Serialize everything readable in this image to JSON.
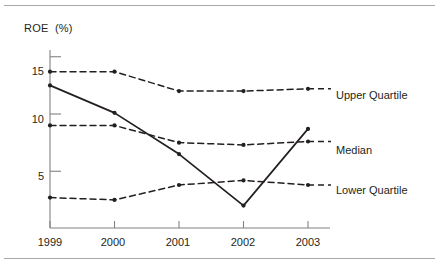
{
  "figure": {
    "axis_title": "ROE  (%)",
    "line_color": "#231f20",
    "rule_color": "#a7a9ac"
  },
  "chart_data": {
    "type": "line",
    "title": "",
    "subtitle": "",
    "xlabel": "",
    "ylabel": "ROE  (%)",
    "categories": [
      "1999",
      "2000",
      "2001",
      "2002",
      "2003"
    ],
    "x": [
      1999,
      2000,
      2001,
      2002,
      2003
    ],
    "ylim": [
      0,
      16.5
    ],
    "xlim": [
      1998.8,
      2003.4
    ],
    "yticks": [
      5,
      10,
      15
    ],
    "ytick_labels": [
      "5",
      "10",
      "15"
    ],
    "xticks": [
      1999,
      2000,
      2001,
      2002,
      2003
    ],
    "grid": false,
    "legend_position": "right-inline",
    "series": [
      {
        "name": "Upper Quartile",
        "style": "dashed",
        "marker": "dot",
        "values": [
          13.7,
          13.7,
          12.0,
          12.0,
          12.2
        ]
      },
      {
        "name": "Median",
        "style": "dashed",
        "marker": "dot",
        "values": [
          9.0,
          9.0,
          7.5,
          7.3,
          7.6
        ]
      },
      {
        "name": "Lower Quartile",
        "style": "dashed",
        "marker": "dot",
        "values": [
          2.7,
          2.5,
          3.8,
          4.2,
          3.8
        ]
      },
      {
        "name": "Company",
        "style": "solid",
        "marker": "dot",
        "values": [
          12.5,
          10.1,
          6.5,
          2.0,
          8.7
        ]
      }
    ],
    "annotations": [
      {
        "text": "Upper Quartile",
        "series": "Upper Quartile"
      },
      {
        "text": "Median",
        "series": "Median"
      },
      {
        "text": "Lower Quartile",
        "series": "Lower Quartile"
      }
    ]
  }
}
